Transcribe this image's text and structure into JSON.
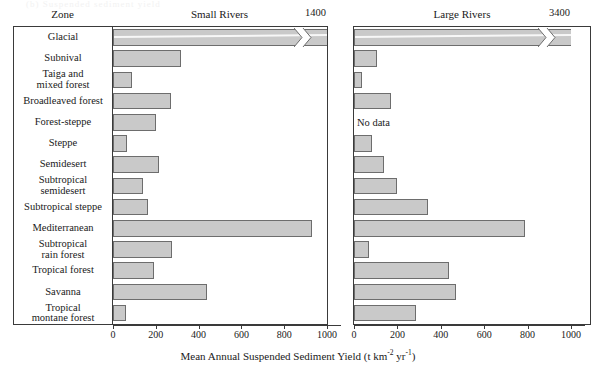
{
  "figure": {
    "faint_top_text": "(b) Suspended sediment yield",
    "zone_column_header": "Zone",
    "x_axis_label_main": "Mean Annual Suspended Sediment Yield (t km",
    "x_axis_label_sup1": "-2",
    "x_axis_label_mid": " yr",
    "x_axis_label_sup2": "-1",
    "x_axis_label_end": ")",
    "no_data_text": "No data",
    "bar_fill": "#c9c9c9",
    "bar_stroke": "#6d6d6d",
    "frame_stroke": "#3a3a3a"
  },
  "chart_data": {
    "type": "bar",
    "orientation": "horizontal",
    "title": "",
    "xlabel": "Mean Annual Suspended Sediment Yield (t km-2 yr-1)",
    "ylabel": "Zone",
    "xlim": [
      0,
      1000
    ],
    "xticks": [
      0,
      200,
      400,
      600,
      800,
      1000
    ],
    "grid": false,
    "legend": "none",
    "categories": [
      "Glacial",
      "Subnival",
      "Taiga and\nmixed forest",
      "Broadleaved forest",
      "Forest-steppe",
      "Steppe",
      "Semidesert",
      "Subtropical\nsemidesert",
      "Subtropical steppe",
      "Mediterranean",
      "Subtropical\nrain forest",
      "Tropical forest",
      "Savanna",
      "Tropical\nmontane forest"
    ],
    "series": [
      {
        "name": "Small Rivers",
        "panel_header": "Small Rivers",
        "overflow_label": "1400",
        "values": [
          1400,
          320,
          90,
          270,
          200,
          65,
          215,
          140,
          165,
          930,
          275,
          190,
          440,
          60
        ],
        "broken_bars": [
          0
        ],
        "no_data_rows": []
      },
      {
        "name": "Large Rivers",
        "panel_header": "Large Rivers",
        "overflow_label": "3400",
        "values": [
          3400,
          105,
          35,
          170,
          null,
          85,
          140,
          200,
          340,
          790,
          70,
          440,
          470,
          285
        ],
        "broken_bars": [
          0
        ],
        "no_data_rows": [
          4
        ]
      }
    ]
  }
}
